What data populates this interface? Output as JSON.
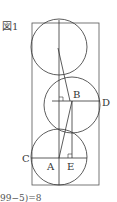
{
  "figure": {
    "title": "図1",
    "labels": {
      "A": "A",
      "B": "B",
      "C": "C",
      "D": "D",
      "E": "E"
    },
    "footer_text": "99−5)=8",
    "stroke_color": "#444444",
    "background": "#ffffff"
  }
}
